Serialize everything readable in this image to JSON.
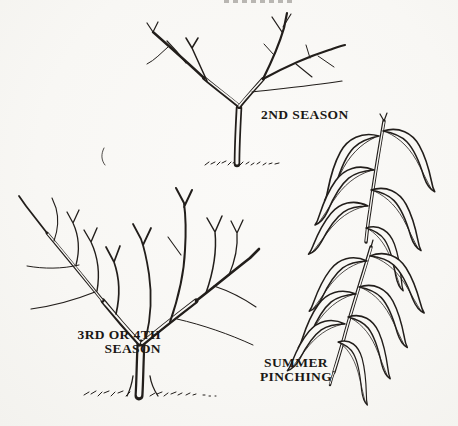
{
  "colors": {
    "paper": "#f8f7f4",
    "ink": "#221e1b"
  },
  "labels": {
    "second_season": "2ND SEASON",
    "third_or_fourth_line1": "3RD OR 4TH",
    "third_or_fourth_line2": "SEASON",
    "summer_pinching_line1": "SUMMER",
    "summer_pinching_line2": "PINCHING"
  }
}
